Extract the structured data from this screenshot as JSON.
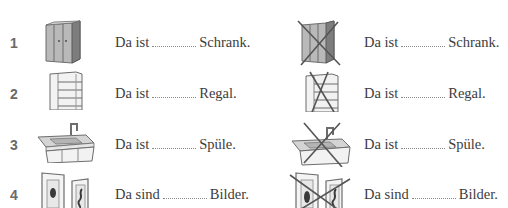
{
  "exercise": {
    "rows": [
      {
        "number": "1",
        "left": {
          "image": "wardrobe-icon",
          "crossed": false,
          "before": "Da ist",
          "after": "Schrank."
        },
        "right": {
          "image": "wardrobe-icon",
          "crossed": true,
          "before": "Da ist",
          "after": "Schrank."
        }
      },
      {
        "number": "2",
        "left": {
          "image": "shelf-icon",
          "crossed": false,
          "before": "Da ist",
          "after": "Regal."
        },
        "right": {
          "image": "shelf-icon",
          "crossed": true,
          "before": "Da ist",
          "after": "Regal."
        }
      },
      {
        "number": "3",
        "left": {
          "image": "sink-icon",
          "crossed": false,
          "before": "Da ist",
          "after": "Spüle."
        },
        "right": {
          "image": "sink-icon",
          "crossed": true,
          "before": "Da ist",
          "after": "Spüle."
        }
      },
      {
        "number": "4",
        "left": {
          "image": "pictures-icon",
          "crossed": false,
          "before": "Da sind",
          "after": "Bilder."
        },
        "right": {
          "image": "pictures-icon",
          "crossed": true,
          "before": "Da sind",
          "after": "Bilder."
        }
      }
    ]
  }
}
